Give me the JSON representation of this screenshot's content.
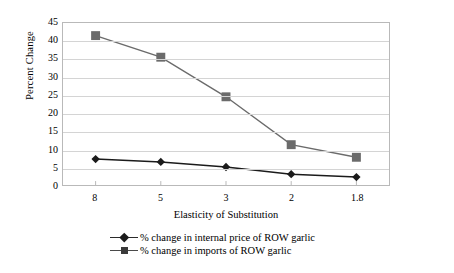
{
  "chart_data": {
    "type": "line",
    "title": "",
    "xlabel": "Elasticity of Substitution",
    "ylabel": "Percent Change",
    "categories": [
      "8",
      "5",
      "3",
      "2",
      "1.8"
    ],
    "ylim": [
      0,
      45
    ],
    "yticks": [
      0,
      5,
      10,
      15,
      20,
      25,
      30,
      35,
      40,
      45
    ],
    "grid": true,
    "legend_position": "bottom",
    "series": [
      {
        "name": "% change in internal price of ROW garlic",
        "marker": "diamond",
        "color": "#1b1b1b",
        "values": [
          7.2,
          6.4,
          5.0,
          3.0,
          2.2
        ]
      },
      {
        "name": "% change in imports of ROW garlic",
        "marker": "square",
        "color": "#6b6b6b",
        "values": [
          41.5,
          35.5,
          24.5,
          11.2,
          7.7
        ]
      }
    ]
  },
  "axes": {
    "y_title": "Percent Change",
    "x_title": "Elasticity of Substitution",
    "y_tick_labels": [
      "45",
      "40",
      "35",
      "30",
      "25",
      "20",
      "15",
      "10",
      "5",
      "0"
    ],
    "x_tick_labels": [
      "8",
      "5",
      "3",
      "2",
      "1.8"
    ]
  },
  "legend": {
    "items": [
      {
        "label": "% change in internal price of ROW garlic",
        "marker": "diamond-marker"
      },
      {
        "label": "% change in imports of ROW garlic",
        "marker": "square-marker"
      }
    ]
  },
  "colors": {
    "series_price": "#1b1b1b",
    "series_imports": "#6b6b6b",
    "grid": "#d4d4d4",
    "frame": "#b9b9b9",
    "background": "#ffffff"
  }
}
